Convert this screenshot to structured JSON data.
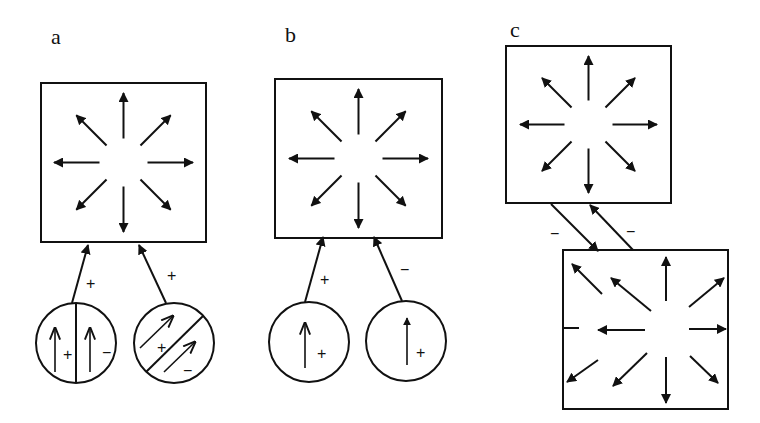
{
  "panels": [
    {
      "id": "a",
      "label": "a",
      "box": {
        "x": 41,
        "y": 83,
        "w": 165,
        "h": 159
      },
      "inputs": [
        {
          "sign": "+",
          "circle": {
            "cx": 76,
            "cy": 343,
            "r": 40
          },
          "type": "split-vertical",
          "inner_signs": [
            "+",
            "−"
          ]
        },
        {
          "sign": "+",
          "circle": {
            "cx": 174,
            "cy": 343,
            "r": 40
          },
          "type": "split-diagonal",
          "inner_signs": [
            "+",
            "−"
          ]
        }
      ]
    },
    {
      "id": "b",
      "label": "b",
      "box": {
        "x": 275,
        "y": 79,
        "w": 167,
        "h": 159
      },
      "inputs": [
        {
          "sign": "+",
          "circle": {
            "cx": 309,
            "cy": 342,
            "r": 40
          },
          "type": "single",
          "inner_signs": [
            "+"
          ]
        },
        {
          "sign": "−",
          "circle": {
            "cx": 406,
            "cy": 341,
            "r": 40
          },
          "type": "single",
          "inner_signs": [
            "+"
          ]
        }
      ]
    },
    {
      "id": "c",
      "label": "c",
      "box_top": {
        "x": 506,
        "y": 46,
        "w": 165,
        "h": 157
      },
      "box_bottom": {
        "x": 563,
        "y": 250,
        "w": 165,
        "h": 159
      },
      "links": [
        {
          "sign": "−"
        },
        {
          "sign": "−"
        }
      ],
      "edge_sign": "−"
    }
  ],
  "colors": {
    "ink": "#111111",
    "background": "#ffffff"
  }
}
